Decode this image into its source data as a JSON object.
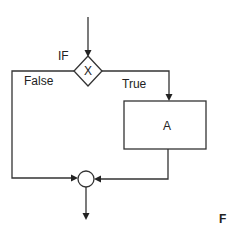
{
  "diagram": {
    "type": "flowchart",
    "nodes": [
      {
        "id": "decision",
        "shape": "diamond",
        "label": "X",
        "annotation": "IF"
      },
      {
        "id": "process",
        "shape": "rectangle",
        "label": "A"
      },
      {
        "id": "join",
        "shape": "circle",
        "label": ""
      }
    ],
    "edges": [
      {
        "from": "entry",
        "to": "decision",
        "label": ""
      },
      {
        "from": "decision",
        "to": "process",
        "label": "True"
      },
      {
        "from": "decision",
        "to": "join",
        "label": "False"
      },
      {
        "from": "process",
        "to": "join",
        "label": ""
      },
      {
        "from": "join",
        "to": "exit",
        "label": ""
      }
    ],
    "labels": {
      "if": "IF",
      "condition": "X",
      "true": "True",
      "false": "False",
      "process": "A",
      "figure_letter": "F"
    },
    "colors": {
      "stroke": "#333333",
      "background": "#ffffff"
    }
  }
}
